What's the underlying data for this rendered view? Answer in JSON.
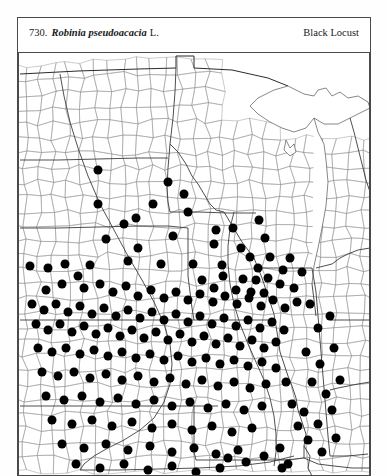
{
  "plate": {
    "number": "730.",
    "scientific_name": "Robinia pseudoacacia",
    "authority": "L.",
    "common_name": "Black Locust"
  },
  "chart_data": {
    "type": "scatter",
    "subtitle": "County-level distribution map, north-central United States",
    "xlabel": "",
    "ylabel": "",
    "grid": false,
    "legend": null,
    "xlim": [
      0,
      352
    ],
    "ylim": [
      0,
      424
    ],
    "marker": {
      "shape": "circle",
      "color": "#000000",
      "diameter_px": 9
    },
    "point_count": 213,
    "points": [
      [
        80,
        118
      ],
      [
        80,
        152
      ],
      [
        135,
        152
      ],
      [
        170,
        160
      ],
      [
        88,
        187
      ],
      [
        198,
        178
      ],
      [
        232,
        205
      ],
      [
        72,
        213
      ],
      [
        110,
        209
      ],
      [
        143,
        212
      ],
      [
        175,
        212
      ],
      [
        204,
        213
      ],
      [
        241,
        168
      ],
      [
        247,
        186
      ],
      [
        120,
        196
      ],
      [
        155,
        184
      ],
      [
        196,
        192
      ],
      [
        215,
        176
      ],
      [
        223,
        196
      ],
      [
        240,
        216
      ],
      [
        252,
        205
      ],
      [
        265,
        218
      ],
      [
        272,
        206
      ],
      [
        225,
        227
      ],
      [
        238,
        228
      ],
      [
        250,
        226
      ],
      [
        262,
        232
      ],
      [
        233,
        240
      ],
      [
        246,
        241
      ],
      [
        205,
        224
      ],
      [
        218,
        238
      ],
      [
        196,
        236
      ],
      [
        184,
        228
      ],
      [
        12,
        214
      ],
      [
        30,
        216
      ],
      [
        47,
        212
      ],
      [
        60,
        224
      ],
      [
        44,
        232
      ],
      [
        28,
        238
      ],
      [
        66,
        236
      ],
      [
        82,
        232
      ],
      [
        95,
        240
      ],
      [
        108,
        234
      ],
      [
        120,
        244
      ],
      [
        133,
        238
      ],
      [
        146,
        246
      ],
      [
        158,
        240
      ],
      [
        170,
        248
      ],
      [
        182,
        242
      ],
      [
        195,
        250
      ],
      [
        207,
        244
      ],
      [
        219,
        252
      ],
      [
        231,
        246
      ],
      [
        243,
        254
      ],
      [
        255,
        248
      ],
      [
        267,
        256
      ],
      [
        279,
        250
      ],
      [
        14,
        252
      ],
      [
        26,
        258
      ],
      [
        38,
        252
      ],
      [
        50,
        260
      ],
      [
        62,
        254
      ],
      [
        74,
        262
      ],
      [
        86,
        256
      ],
      [
        98,
        264
      ],
      [
        110,
        258
      ],
      [
        122,
        266
      ],
      [
        134,
        260
      ],
      [
        146,
        268
      ],
      [
        158,
        262
      ],
      [
        170,
        270
      ],
      [
        182,
        264
      ],
      [
        194,
        272
      ],
      [
        206,
        266
      ],
      [
        218,
        274
      ],
      [
        230,
        268
      ],
      [
        242,
        276
      ],
      [
        254,
        270
      ],
      [
        266,
        278
      ],
      [
        18,
        272
      ],
      [
        30,
        278
      ],
      [
        42,
        272
      ],
      [
        54,
        280
      ],
      [
        66,
        274
      ],
      [
        78,
        282
      ],
      [
        90,
        276
      ],
      [
        102,
        284
      ],
      [
        114,
        278
      ],
      [
        126,
        286
      ],
      [
        138,
        280
      ],
      [
        150,
        288
      ],
      [
        162,
        282
      ],
      [
        174,
        290
      ],
      [
        186,
        284
      ],
      [
        198,
        292
      ],
      [
        210,
        286
      ],
      [
        222,
        294
      ],
      [
        234,
        288
      ],
      [
        246,
        296
      ],
      [
        258,
        290
      ],
      [
        20,
        296
      ],
      [
        34,
        300
      ],
      [
        48,
        296
      ],
      [
        62,
        302
      ],
      [
        76,
        298
      ],
      [
        90,
        304
      ],
      [
        104,
        300
      ],
      [
        118,
        306
      ],
      [
        132,
        302
      ],
      [
        146,
        308
      ],
      [
        160,
        304
      ],
      [
        174,
        310
      ],
      [
        188,
        306
      ],
      [
        202,
        312
      ],
      [
        216,
        308
      ],
      [
        230,
        314
      ],
      [
        244,
        310
      ],
      [
        258,
        316
      ],
      [
        24,
        320
      ],
      [
        40,
        324
      ],
      [
        56,
        320
      ],
      [
        72,
        326
      ],
      [
        88,
        322
      ],
      [
        104,
        328
      ],
      [
        120,
        324
      ],
      [
        136,
        330
      ],
      [
        152,
        326
      ],
      [
        168,
        332
      ],
      [
        184,
        328
      ],
      [
        200,
        334
      ],
      [
        216,
        330
      ],
      [
        232,
        336
      ],
      [
        248,
        332
      ],
      [
        28,
        344
      ],
      [
        46,
        348
      ],
      [
        64,
        344
      ],
      [
        82,
        350
      ],
      [
        100,
        346
      ],
      [
        118,
        352
      ],
      [
        136,
        348
      ],
      [
        154,
        354
      ],
      [
        172,
        350
      ],
      [
        190,
        356
      ],
      [
        208,
        352
      ],
      [
        226,
        358
      ],
      [
        244,
        354
      ],
      [
        34,
        368
      ],
      [
        54,
        372
      ],
      [
        74,
        368
      ],
      [
        94,
        374
      ],
      [
        114,
        370
      ],
      [
        134,
        376
      ],
      [
        154,
        372
      ],
      [
        174,
        378
      ],
      [
        194,
        374
      ],
      [
        214,
        380
      ],
      [
        234,
        376
      ],
      [
        44,
        392
      ],
      [
        66,
        396
      ],
      [
        88,
        392
      ],
      [
        110,
        398
      ],
      [
        132,
        394
      ],
      [
        154,
        400
      ],
      [
        176,
        396
      ],
      [
        198,
        402
      ],
      [
        220,
        398
      ],
      [
        58,
        412
      ],
      [
        82,
        416
      ],
      [
        106,
        412
      ],
      [
        130,
        418
      ],
      [
        154,
        414
      ],
      [
        178,
        420
      ],
      [
        202,
        416
      ],
      [
        292,
        252
      ],
      [
        300,
        276
      ],
      [
        312,
        264
      ],
      [
        288,
        300
      ],
      [
        302,
        312
      ],
      [
        316,
        296
      ],
      [
        294,
        330
      ],
      [
        308,
        342
      ],
      [
        322,
        328
      ],
      [
        286,
        360
      ],
      [
        300,
        372
      ],
      [
        314,
        358
      ],
      [
        290,
        388
      ],
      [
        304,
        400
      ],
      [
        318,
        386
      ],
      [
        276,
        236
      ],
      [
        284,
        220
      ],
      [
        268,
        330
      ],
      [
        274,
        352
      ],
      [
        280,
        374
      ],
      [
        262,
        396
      ],
      [
        270,
        412
      ],
      [
        210,
        406
      ],
      [
        228,
        410
      ],
      [
        246,
        404
      ],
      [
        264,
        416
      ],
      [
        150,
        130
      ],
      [
        166,
        142
      ],
      [
        106,
        172
      ],
      [
        118,
        166
      ]
    ]
  }
}
